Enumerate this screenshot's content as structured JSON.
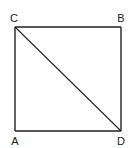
{
  "diagram": {
    "type": "geometry",
    "shape": "square-with-diagonal",
    "stroke_color": "#222222",
    "background": "#ffffff",
    "vertices": [
      {
        "label": "C",
        "x": 15,
        "y": 27,
        "label_x": 14,
        "label_y": 22
      },
      {
        "label": "B",
        "x": 121,
        "y": 27,
        "label_x": 121,
        "label_y": 22
      },
      {
        "label": "A",
        "x": 15,
        "y": 131,
        "label_x": 15,
        "label_y": 145
      },
      {
        "label": "D",
        "x": 121,
        "y": 131,
        "label_x": 121,
        "label_y": 145
      }
    ],
    "edges": [
      {
        "from": "C",
        "to": "B"
      },
      {
        "from": "B",
        "to": "D"
      },
      {
        "from": "D",
        "to": "A"
      },
      {
        "from": "A",
        "to": "C"
      }
    ],
    "diagonal": {
      "from": "C",
      "to": "D"
    }
  }
}
